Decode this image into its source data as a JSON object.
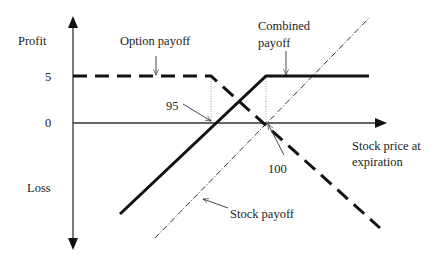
{
  "diagram": {
    "type": "payoff-diagram",
    "axes": {
      "y_top_label": "Profit",
      "y_bottom_label": "Loss",
      "x_label_line1": "Stock price at",
      "x_label_line2": "expiration",
      "y_tick_5": "5",
      "y_tick_0": "0"
    },
    "annotations": {
      "option_payoff": "Option payoff",
      "combined_payoff_line1": "Combined",
      "combined_payoff_line2": "payoff",
      "stock_payoff": "Stock payoff",
      "strike_95": "95",
      "strike_100": "100"
    },
    "series": [
      {
        "name": "Option payoff",
        "style": "dashed",
        "points": [
          [
            "start",
            5
          ],
          [
            95,
            5
          ],
          [
            "end",
            "declining"
          ]
        ]
      },
      {
        "name": "Combined payoff",
        "style": "solid",
        "points": [
          [
            "start",
            "loss"
          ],
          [
            95,
            0
          ],
          [
            100,
            5
          ],
          [
            "end",
            5
          ]
        ]
      },
      {
        "name": "Stock payoff",
        "style": "dash-dot",
        "points": [
          [
            100,
            0
          ],
          [
            "slope",
            1
          ]
        ]
      }
    ],
    "colors": {
      "line": "#111111",
      "axis": "#333333",
      "guide": "#888888"
    }
  }
}
